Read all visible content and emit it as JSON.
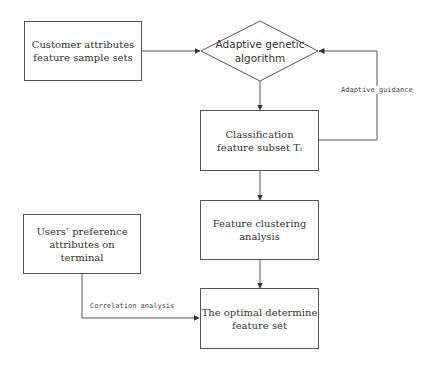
{
  "diagram": {
    "nodes": {
      "customer_attributes": {
        "label": "Customer attributes\nfeature sample sets",
        "shape": "rect"
      },
      "adaptive_ga": {
        "label": "Adaptive genetic\nalgorithm",
        "shape": "diamond"
      },
      "classification_subset": {
        "label": "Classification\nfeature subset Tᵢ",
        "shape": "rect"
      },
      "feature_clustering": {
        "label": "Feature clustering\nanalysis",
        "shape": "rect"
      },
      "users_preference": {
        "label": "Users’ preference\nattributes on\nterminal",
        "shape": "rect"
      },
      "optimal_feature_set": {
        "label": "The optimal determine\nfeature set",
        "shape": "rect"
      }
    },
    "edges": [
      {
        "from": "customer_attributes",
        "to": "adaptive_ga",
        "label": ""
      },
      {
        "from": "adaptive_ga",
        "to": "classification_subset",
        "label": ""
      },
      {
        "from": "classification_subset",
        "to": "adaptive_ga",
        "label": "Adaptive guidance"
      },
      {
        "from": "classification_subset",
        "to": "feature_clustering",
        "label": ""
      },
      {
        "from": "feature_clustering",
        "to": "optimal_feature_set",
        "label": ""
      },
      {
        "from": "users_preference",
        "to": "optimal_feature_set",
        "label": "Correlation analysis"
      }
    ],
    "edge_labels": {
      "adaptive_guidance": "Adaptive guidance",
      "correlation_analysis": "Correlation analysis"
    },
    "colors": {
      "stroke": "#555555",
      "text": "#333333",
      "background": "#ffffff"
    }
  }
}
